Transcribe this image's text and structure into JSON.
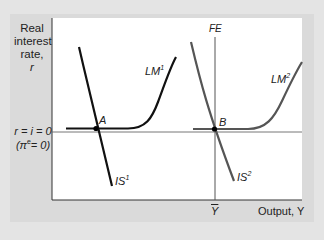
{
  "diagram": {
    "type": "IS-LM-FE liquidity trap diagram",
    "y_axis": {
      "label_line1": "Real",
      "label_line2": "interest",
      "label_line3": "rate,",
      "label_symbol": "r"
    },
    "x_axis": {
      "label": "Output, Y",
      "tick_label": "Y",
      "tick_overbar": true
    },
    "reference_line": {
      "label_line1": "r = i = 0",
      "label_line2_prefix": "(π",
      "label_line2_sup": "e",
      "label_line2_suffix": "= 0)"
    },
    "curves": {
      "is1": {
        "name": "IS",
        "sup": "1",
        "color": "#111111"
      },
      "lm1": {
        "name": "LM",
        "sup": "1",
        "color": "#111111"
      },
      "is2": {
        "name": "IS",
        "sup": "2",
        "color": "#555555"
      },
      "lm2": {
        "name": "LM",
        "sup": "2",
        "color": "#555555"
      },
      "fe": {
        "name": "FE",
        "color": "#555555"
      }
    },
    "points": {
      "a": {
        "label": "A"
      },
      "b": {
        "label": "B"
      }
    }
  }
}
